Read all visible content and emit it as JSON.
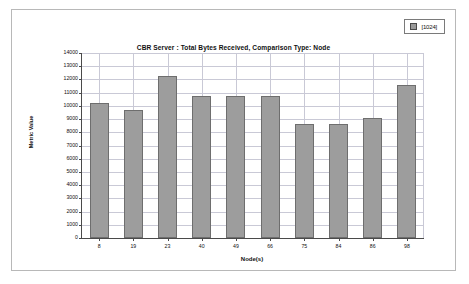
{
  "legend": {
    "swatch_color": "#9a9a9a",
    "label": "[1024]",
    "icon": "square-swatch-icon"
  },
  "chart_data": {
    "type": "bar",
    "title": "CBR Server :  Total Bytes Received, Comparison Type: Node",
    "xlabel": "Node(s)",
    "ylabel": "Metric Value",
    "categories": [
      "8",
      "19",
      "23",
      "40",
      "49",
      "66",
      "75",
      "84",
      "86",
      "98"
    ],
    "values": [
      10200,
      9700,
      12250,
      10750,
      10750,
      10750,
      8600,
      8600,
      9100,
      11550
    ],
    "series": [
      {
        "name": "[1024]",
        "values": [
          10200,
          9700,
          12250,
          10750,
          10750,
          10750,
          8600,
          8600,
          9100,
          11550
        ]
      }
    ],
    "ylim": [
      0,
      14000
    ],
    "ytick_labels": [
      "14000",
      "13000",
      "12000",
      "11000",
      "10000",
      "9000",
      "8000",
      "7000",
      "6000",
      "5000",
      "4000",
      "3000",
      "2000",
      "1000",
      "0"
    ],
    "ytick_values": [
      14000,
      13000,
      12000,
      11000,
      10000,
      9000,
      8000,
      7000,
      6000,
      5000,
      4000,
      3000,
      2000,
      1000,
      0
    ],
    "grid": true,
    "legend_position": "top-right",
    "bar_color": "#9d9d9d",
    "bar_border_color": "#6e6e6e",
    "grid_color": "#c9c9d6",
    "axis_color": "#4a4a4a"
  }
}
